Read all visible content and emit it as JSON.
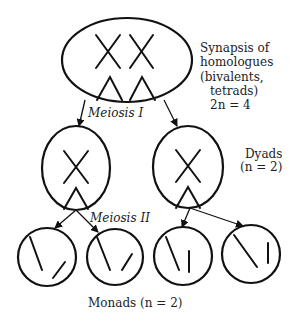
{
  "diagram": {
    "type": "meiosis",
    "stages": {
      "parent": {
        "label_lines": [
          "Synapsis of",
          "homologues",
          "(bivalents,",
          "tetrads)",
          "2n = 4"
        ]
      },
      "meiosis_1": {
        "label": "Meiosis I"
      },
      "dyads": {
        "label_lines": [
          "Dyads",
          "(n = 2)"
        ]
      },
      "meiosis_2": {
        "label": "Meiosis II"
      },
      "monads": {
        "label": "Monads (n = 2)"
      }
    },
    "colors": {
      "stroke": "#111111",
      "text": "#222222",
      "background": "#ffffff"
    }
  }
}
